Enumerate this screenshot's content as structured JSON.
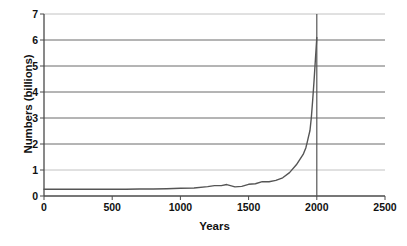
{
  "chart_data": {
    "type": "line",
    "title": "",
    "xlabel": "Years",
    "ylabel": "Numbers (billions)",
    "xlim": [
      0,
      2500
    ],
    "ylim": [
      0,
      7
    ],
    "xticks": [
      0,
      500,
      1000,
      1500,
      2000,
      2500
    ],
    "xtick_labels": [
      "0",
      "500",
      "1000",
      "1500",
      "2000",
      "2500"
    ],
    "yticks": [
      0,
      1,
      2,
      3,
      4,
      5,
      6,
      7
    ],
    "ytick_labels": [
      "0",
      "1",
      "2",
      "3",
      "4",
      "5",
      "6",
      "7"
    ],
    "grid": "horizontal-gridlines-plus-vertical-line-at-2000",
    "legend": "none",
    "series": [
      {
        "name": "World population",
        "color": "#555555",
        "x": [
          0,
          100,
          200,
          300,
          400,
          500,
          600,
          700,
          800,
          900,
          1000,
          1100,
          1200,
          1250,
          1300,
          1340,
          1400,
          1450,
          1500,
          1550,
          1600,
          1650,
          1700,
          1750,
          1800,
          1850,
          1900,
          1920,
          1930,
          1940,
          1950,
          1960,
          1970,
          1980,
          1990,
          1999,
          2000
        ],
        "y": [
          0.26,
          0.26,
          0.26,
          0.26,
          0.26,
          0.26,
          0.26,
          0.27,
          0.27,
          0.28,
          0.3,
          0.31,
          0.36,
          0.4,
          0.4,
          0.44,
          0.35,
          0.37,
          0.45,
          0.47,
          0.55,
          0.55,
          0.6,
          0.7,
          0.9,
          1.2,
          1.6,
          1.86,
          2.07,
          2.3,
          2.52,
          3.02,
          3.7,
          4.44,
          5.27,
          6.0,
          6.1
        ]
      }
    ],
    "annotations": [
      {
        "type": "vertical-line",
        "x": 2000,
        "color": "#555555"
      }
    ]
  },
  "axes": {
    "y_title": "Numbers (billions)",
    "x_title": "Years"
  }
}
